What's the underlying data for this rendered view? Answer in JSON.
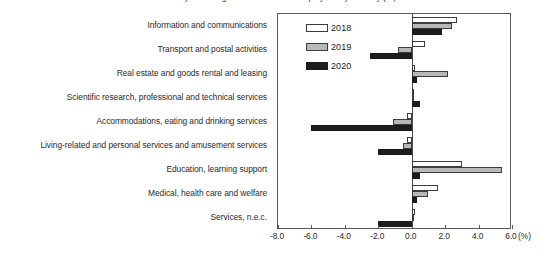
{
  "chart_data": {
    "type": "bar",
    "orientation": "horizontal",
    "title": "Year-on-year change in the number of employees by industry (%)",
    "xlabel": "",
    "ylabel": "",
    "unit_label": "(%)",
    "xlim": [
      -8.0,
      6.0
    ],
    "xticks": [
      -8.0,
      -6.0,
      -4.0,
      -2.0,
      0.0,
      2.0,
      4.0,
      6.0
    ],
    "xtick_labels": [
      "-8.0",
      "-6.0",
      "-4.0",
      "-2.0",
      "0.0",
      "2.0",
      "4.0",
      "6.0"
    ],
    "grid": false,
    "legend_position": "top-left-inside",
    "categories": [
      "Information and communications",
      "Transport and postal activities",
      "Real estate and goods rental and leasing",
      "Scientific research, professional and technical services",
      "Accommodations, eating and drinking services",
      "Living-related and personal services and amusement services",
      "Education, learning support",
      "Medical, health care and welfare",
      "Services, n.e.c."
    ],
    "series": [
      {
        "name": "2018",
        "color": "#ffffff",
        "values": [
          2.7,
          0.8,
          0.2,
          0.1,
          -0.3,
          -0.3,
          3.0,
          1.6,
          0.2
        ]
      },
      {
        "name": "2019",
        "color": "#b8b8b8",
        "values": [
          2.4,
          -0.8,
          2.2,
          0.1,
          -1.1,
          -0.5,
          5.4,
          1.0,
          0.1
        ]
      },
      {
        "name": "2020",
        "color": "#1c1c1c",
        "values": [
          1.8,
          -2.5,
          0.3,
          0.5,
          -6.0,
          -2.0,
          0.5,
          0.3,
          -2.0
        ]
      }
    ]
  },
  "legend": {
    "items": [
      {
        "label": "2018",
        "key": "y2018"
      },
      {
        "label": "2019",
        "key": "y2019"
      },
      {
        "label": "2020",
        "key": "y2020"
      }
    ]
  }
}
